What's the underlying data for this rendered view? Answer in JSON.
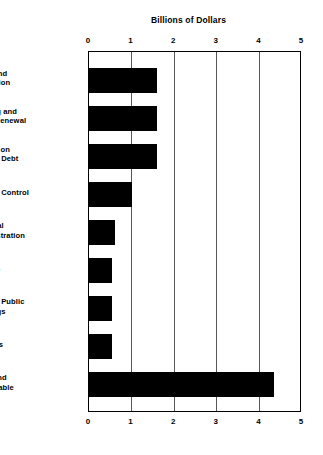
{
  "chart_data": {
    "type": "bar",
    "orientation": "horizontal",
    "title": "Billions of Dollars",
    "xlabel": "",
    "ylabel": "",
    "xlim": [
      0,
      5
    ],
    "xticks": [
      "0",
      "1",
      "2",
      "3",
      "4",
      "5"
    ],
    "grid": true,
    "legend": false,
    "bar_color": "#000000",
    "categories": [
      "Parks and Recreation",
      "Housing and Urban Renewal",
      "Interest on General Debt",
      "General Control",
      "Financial Administration",
      "Airports",
      "General Public Buildings",
      "Libraries",
      "Other and Unallocable"
    ],
    "category_lines": [
      [
        "Parks and",
        "Recreation"
      ],
      [
        "Housing and",
        "Urban Renewal"
      ],
      [
        "Interest on",
        "General Debt"
      ],
      [
        "General Control"
      ],
      [
        "Financial",
        "Administration"
      ],
      [
        "Airports"
      ],
      [
        "General Public",
        "Buildings"
      ],
      [
        "Libraries"
      ],
      [
        "Other and",
        "Unallocable"
      ]
    ],
    "values": [
      1.6,
      1.6,
      1.6,
      1.0,
      0.62,
      0.55,
      0.55,
      0.55,
      4.35
    ]
  }
}
